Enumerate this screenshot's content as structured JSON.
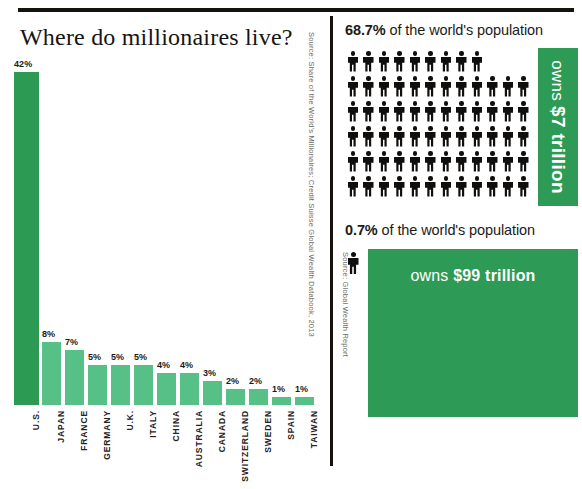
{
  "rules": {
    "top_rule_color": "#16130f",
    "divider_color": "#16130f"
  },
  "left": {
    "title": "Where do millionaires live?",
    "source": "Source: Share of the World's Millionaires; Credit Suisse Global Wealth Databook, 2013",
    "colors": {
      "primary_bar": "#2d9a54",
      "secondary_bar": "#57c086"
    }
  },
  "right": {
    "top_stat": {
      "percent": "68.7%",
      "rest": " of the world's population",
      "people_icon_count": 69,
      "people_per_row": 12,
      "strip_prefix": "owns ",
      "strip_value": "$7 trillion"
    },
    "bottom_stat": {
      "percent": "0.7%",
      "rest": " of the world's population",
      "people_icon_count": 1,
      "block_prefix": "owns ",
      "block_value": "$99 trillion"
    },
    "source": "Source: Global Wealth Report",
    "colors": {
      "green_block": "#2d9a55"
    }
  },
  "chart_data": {
    "type": "bar",
    "title": "Where do millionaires live?",
    "xlabel": "",
    "ylabel": "",
    "ylim": [
      0,
      42
    ],
    "grid": false,
    "legend": "none",
    "unit": "%",
    "categories": [
      "U.S.",
      "JAPAN",
      "FRANCE",
      "GERMANY",
      "U.K.",
      "ITALY",
      "CHINA",
      "AUSTRALIA",
      "CANADA",
      "SWITZERLAND",
      "SWEDEN",
      "SPAIN",
      "TAIWAN"
    ],
    "values": [
      42,
      8,
      7,
      5,
      5,
      5,
      4,
      4,
      3,
      2,
      2,
      1,
      1
    ],
    "value_labels": [
      "42%",
      "8%",
      "7%",
      "5%",
      "5%",
      "5%",
      "4%",
      "4%",
      "3%",
      "2%",
      "2%",
      "1%",
      "1%"
    ],
    "highlight_index": 0
  }
}
